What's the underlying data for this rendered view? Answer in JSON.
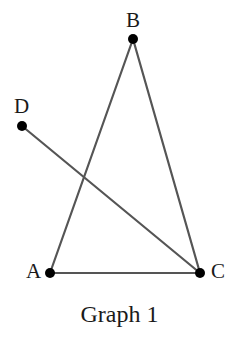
{
  "figure": {
    "caption": "Graph 1",
    "background_color": "#ffffff",
    "edge_color": "#555555",
    "vertex_color": "#000000",
    "label_color": "#1a1a1a",
    "edge_width": 2.2,
    "vertex_radius": 5
  },
  "chart_data": {
    "type": "diagram",
    "title": "Graph 1",
    "subtype": "undirected-graph",
    "xlabel": "",
    "ylabel": "",
    "grid": false,
    "legend": "none",
    "xlim": [
      0,
      239
    ],
    "ylim": [
      0,
      339
    ],
    "nodes": [
      {
        "id": "B",
        "label": "B",
        "x": 133,
        "y": 39,
        "label_x": 126,
        "label_y": 10,
        "degree": 2
      },
      {
        "id": "D",
        "label": "D",
        "x": 22,
        "y": 126,
        "label_x": 14,
        "label_y": 96,
        "degree": 1
      },
      {
        "id": "A",
        "label": "A",
        "x": 50,
        "y": 273,
        "label_x": 26,
        "label_y": 261,
        "degree": 2
      },
      {
        "id": "C",
        "label": "C",
        "x": 200,
        "y": 273,
        "label_x": 211,
        "label_y": 261,
        "degree": 3
      }
    ],
    "edges": [
      {
        "id": "edge-A-B",
        "from": "A",
        "to": "B"
      },
      {
        "id": "edge-B-C",
        "from": "B",
        "to": "C"
      },
      {
        "id": "edge-A-C",
        "from": "A",
        "to": "C"
      },
      {
        "id": "edge-D-C",
        "from": "D",
        "to": "C"
      }
    ],
    "crossings": [
      {
        "edges": [
          "edge-A-B",
          "edge-D-C"
        ],
        "x": 85,
        "y": 177
      }
    ]
  },
  "labels": {
    "A": "A",
    "B": "B",
    "C": "C",
    "D": "D"
  }
}
